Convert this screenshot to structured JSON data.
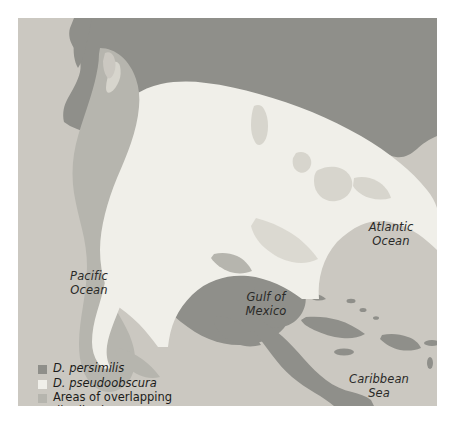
{
  "figure": {
    "type": "distribution-map",
    "region": "North America, Central America and the Caribbean"
  },
  "map": {
    "colors": {
      "ocean": "#cbc8c1",
      "land_outside_range": "#8f8f8a",
      "d_pseudoobscura_range": "#f0efe9",
      "overlap_range": "#b6b5ae",
      "great_lakes": "#d7d5cd"
    }
  },
  "ocean_labels": [
    {
      "name": "pacific-ocean",
      "text": "Pacific\nOcean"
    },
    {
      "name": "atlantic-ocean",
      "text": "Atlantic\nOcean"
    },
    {
      "name": "gulf-of-mexico",
      "text": "Gulf of\nMexico"
    },
    {
      "name": "caribbean-sea",
      "text": "Caribbean\nSea"
    }
  ],
  "legend": {
    "items": [
      {
        "label": "D. persimilis",
        "color": "#8f8f8a",
        "italic": true
      },
      {
        "label": "D. pseudoobscura",
        "color": "#f0efe9",
        "italic": true
      },
      {
        "label": "Areas of overlapping\ndistribution",
        "color": "#b6b5ae",
        "italic": false
      }
    ]
  }
}
